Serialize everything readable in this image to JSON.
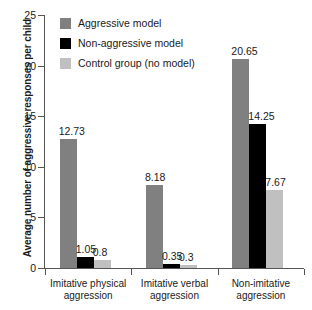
{
  "chart_data": {
    "type": "bar",
    "title": "",
    "subtitle": "",
    "xlabel": "",
    "ylabel": "Average number of aggressive responses per child",
    "ylim": [
      0,
      25
    ],
    "yticks": [
      0,
      5,
      10,
      15,
      20,
      25
    ],
    "grid": false,
    "legend_position": "top-left inside plot",
    "categories": [
      "Imitative physical aggression",
      "Imitative verbal aggression",
      "Non-imitative aggression"
    ],
    "category_lines": [
      [
        "Imitative physical",
        "aggression"
      ],
      [
        "Imitative verbal",
        "aggression"
      ],
      [
        "Non-imitative",
        "aggression"
      ]
    ],
    "series": [
      {
        "name": "Aggressive model",
        "color": "#808080",
        "values": [
          12.73,
          8.18,
          20.65
        ],
        "labels": [
          "12.73",
          "8.18",
          "20.65"
        ]
      },
      {
        "name": "Non-aggressive model",
        "color": "#000000",
        "values": [
          1.05,
          0.35,
          14.25
        ],
        "labels": [
          "1.05",
          "0.35",
          "14.25"
        ]
      },
      {
        "name": "Control group (no model)",
        "color": "#c0c0c0",
        "values": [
          0.8,
          0.3,
          7.67
        ],
        "labels": [
          "0.8",
          "0.3",
          "7.67"
        ]
      }
    ]
  },
  "axis": {
    "y_tick_labels": [
      "0",
      "5",
      "10",
      "15",
      "20",
      "25"
    ],
    "y_label": "Average number of aggressive responses per child"
  },
  "legend": {
    "items": [
      {
        "label": "Aggressive model",
        "color": "#808080"
      },
      {
        "label": "Non-aggressive model",
        "color": "#000000"
      },
      {
        "label": "Control group (no model)",
        "color": "#c0c0c0"
      }
    ]
  }
}
